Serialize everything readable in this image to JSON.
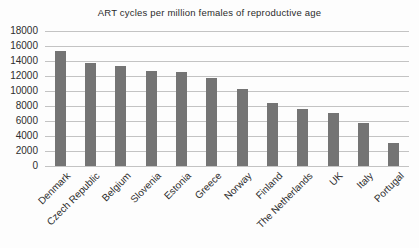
{
  "chart_data": {
    "type": "bar",
    "title": "ART cycles per million females of reproductive age",
    "categories": [
      "Denmark",
      "Czech Republic",
      "Belgium",
      "Slovenia",
      "Estonia",
      "Greece",
      "Norway",
      "Finland",
      "The Netherlands",
      "UK",
      "Italy",
      "Portugal"
    ],
    "values": [
      15300,
      13800,
      13300,
      12700,
      12500,
      11800,
      10300,
      8400,
      7600,
      7100,
      5700,
      3100
    ],
    "xlabel": "",
    "ylabel": "",
    "ylim": [
      0,
      18000
    ],
    "ytick_step": 2000,
    "ytick_labels": [
      "18000",
      "16000",
      "14000",
      "12000",
      "10000",
      "8000",
      "6000",
      "4000",
      "2000",
      "0"
    ],
    "grid": true,
    "legend": "none",
    "bar_color": "#747474",
    "gridline_color": "#c3c3c3",
    "text_color": "#2e2e2e",
    "background_color": "#fdfdfd"
  }
}
